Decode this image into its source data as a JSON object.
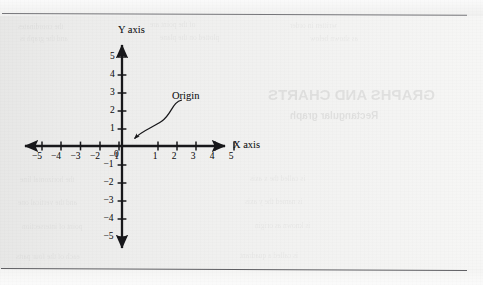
{
  "figure": {
    "kind": "cartesian-coordinate-plane",
    "ink_color": "#17171a",
    "paper_color": "#efefee",
    "rule_color": "#6e6e72"
  },
  "axes": {
    "x_axis_label": "X axis",
    "y_axis_label": "Y axis",
    "origin_label": "0"
  },
  "callout": {
    "label": "Origin"
  },
  "chart_data": {
    "type": "scatter",
    "title": "",
    "subtitle": "",
    "xlabel": "X axis",
    "ylabel": "Y axis",
    "xlim": [
      -5,
      5
    ],
    "ylim": [
      -5,
      5
    ],
    "grid": false,
    "legend": "none",
    "x_ticks": [
      -5,
      -4,
      -3,
      -2,
      -1,
      0,
      1,
      2,
      3,
      4,
      5
    ],
    "y_ticks": [
      -5,
      -4,
      -3,
      -2,
      -1,
      1,
      2,
      3,
      4,
      5
    ],
    "x_tick_labels": [
      "-5",
      "-4",
      "-3",
      "-2",
      "-1",
      "0",
      "1",
      "2",
      "3",
      "4",
      "5"
    ],
    "y_tick_labels": [
      "-5",
      "-4",
      "-3",
      "-2",
      "-1",
      "1",
      "2",
      "3",
      "4",
      "5"
    ],
    "series": [],
    "values": [],
    "annotations": [
      {
        "text": "Origin",
        "points_to_x": 0,
        "points_to_y": 0,
        "arrow": "curved"
      }
    ]
  },
  "x_tick_marks": [
    {
      "value": "-5",
      "px": 42
    },
    {
      "value": "-4",
      "px": 61
    },
    {
      "value": "-3",
      "px": 80.5
    },
    {
      "value": "-2",
      "px": 100
    },
    {
      "value": "-1",
      "px": 119
    },
    {
      "value": "1",
      "px": 158
    },
    {
      "value": "2",
      "px": 177
    },
    {
      "value": "3",
      "px": 196
    },
    {
      "value": "4",
      "px": 215
    },
    {
      "value": "5",
      "px": 234
    }
  ],
  "y_tick_marks": [
    {
      "value": "5",
      "px": 57
    },
    {
      "value": "4",
      "px": 75
    },
    {
      "value": "3",
      "px": 93
    },
    {
      "value": "2",
      "px": 111
    },
    {
      "value": "1",
      "px": 129
    },
    {
      "value": "-1",
      "px": 165
    },
    {
      "value": "-2",
      "px": 183
    },
    {
      "value": "-3",
      "px": 201
    },
    {
      "value": "-4",
      "px": 219
    },
    {
      "value": "-5",
      "px": 237
    }
  ],
  "showthrough": [
    {
      "text": "the coordinates",
      "x": 18,
      "y": 22,
      "size": 7.5,
      "class": "ghost"
    },
    {
      "text": "of the point are",
      "x": 150,
      "y": 20,
      "size": 7.5,
      "class": "ghost"
    },
    {
      "text": "written in order",
      "x": 290,
      "y": 21,
      "size": 7.5,
      "class": "ghost"
    },
    {
      "text": "and the graph is",
      "x": 20,
      "y": 34,
      "size": 7.5,
      "class": "ghost"
    },
    {
      "text": "plotted on the plane",
      "x": 160,
      "y": 33,
      "size": 7.5,
      "class": "ghost"
    },
    {
      "text": "as shown below",
      "x": 310,
      "y": 34,
      "size": 7.5,
      "class": "ghost"
    },
    {
      "text": "GRAPHS AND CHARTS",
      "x": 268,
      "y": 86,
      "size": 15,
      "class": "ghost ghost-head"
    },
    {
      "text": "Rectangular graph",
      "x": 290,
      "y": 110,
      "size": 10,
      "class": "ghost ghost-head"
    },
    {
      "text": "the horizontal line",
      "x": 20,
      "y": 175,
      "size": 7.5,
      "class": "ghost"
    },
    {
      "text": "is called the x axis",
      "x": 250,
      "y": 174,
      "size": 7.5,
      "class": "ghost"
    },
    {
      "text": "and the vertical one",
      "x": 18,
      "y": 198,
      "size": 7.5,
      "class": "ghost"
    },
    {
      "text": "is named the y axis",
      "x": 245,
      "y": 197,
      "size": 7.5,
      "class": "ghost"
    },
    {
      "text": "point of intersection",
      "x": 22,
      "y": 222,
      "size": 7.5,
      "class": "ghost"
    },
    {
      "text": "is known as origin",
      "x": 255,
      "y": 221,
      "size": 7.5,
      "class": "ghost"
    },
    {
      "text": "each of the four parts",
      "x": 16,
      "y": 252,
      "size": 7.5,
      "class": "ghost"
    },
    {
      "text": "is called a quadrant",
      "x": 240,
      "y": 251,
      "size": 7.5,
      "class": "ghost"
    }
  ]
}
